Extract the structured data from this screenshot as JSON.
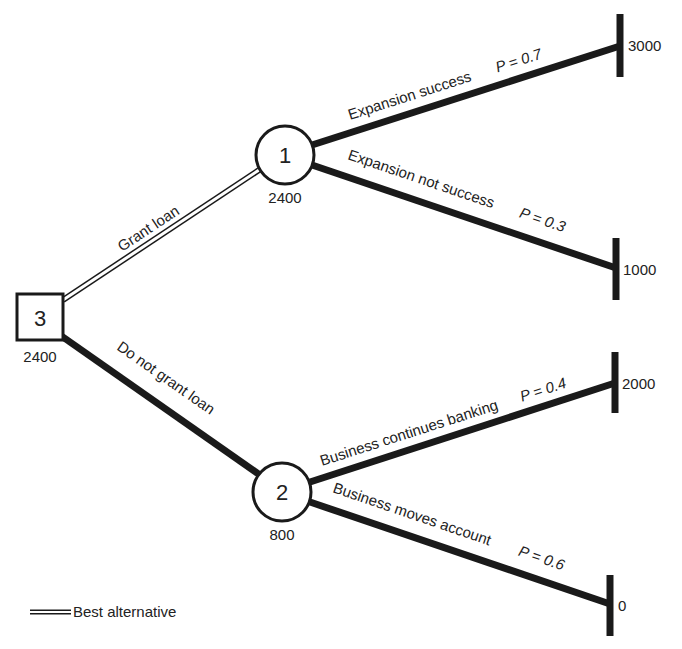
{
  "diagram": {
    "type": "decision-tree",
    "colors": {
      "line": "#1a1a1a",
      "text": "#222222",
      "background": "#ffffff"
    },
    "nodes": {
      "decision": {
        "label": "3",
        "value": "2400",
        "shape": "square"
      },
      "chance1": {
        "label": "1",
        "value": "2400",
        "shape": "circle"
      },
      "chance2": {
        "label": "2",
        "value": "800",
        "shape": "circle"
      }
    },
    "branches": {
      "grant": {
        "label": "Grant loan",
        "style": "double-line"
      },
      "no_grant": {
        "label": "Do not grant loan",
        "style": "thick"
      },
      "exp_success": {
        "label": "Expansion success",
        "prob": "P = 0.7"
      },
      "exp_fail": {
        "label": "Expansion not success",
        "prob": "P = 0.3"
      },
      "biz_continue": {
        "label": "Business continues banking",
        "prob": "P = 0.4"
      },
      "biz_move": {
        "label": "Business moves account",
        "prob": "P = 0.6"
      }
    },
    "terminals": {
      "t1": "3000",
      "t2": "1000",
      "t3": "2000",
      "t4": "0"
    },
    "legend": {
      "label": "Best alternative",
      "symbol": "double-line"
    }
  }
}
